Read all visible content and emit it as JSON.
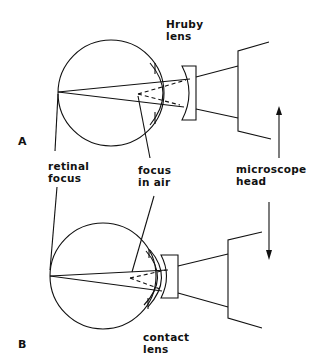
{
  "figure": {
    "panels": [
      {
        "id": "A",
        "label": "A",
        "lens_label_line1": "Hruby",
        "lens_label_line2": "lens"
      },
      {
        "id": "B",
        "label": "B",
        "lens_label_line1": "contact",
        "lens_label_line2": "lens"
      }
    ],
    "shared_labels": {
      "retinal_focus_line1": "retinal",
      "retinal_focus_line2": "focus",
      "focus_in_air_line1": "focus",
      "focus_in_air_line2": "in air",
      "microscope_head_line1": "microscope",
      "microscope_head_line2": "head"
    },
    "colors": {
      "line": "#111111",
      "background": "#ffffff"
    }
  }
}
